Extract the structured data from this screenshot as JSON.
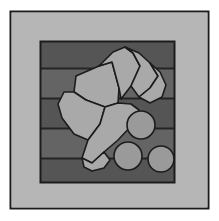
{
  "figure": {
    "width": 219,
    "height": 221,
    "background_color": "#ffffff"
  },
  "colors": {
    "page_background": "#ffffff",
    "frame_fill": "#b6b6b6",
    "panel_dark_band": "#555555",
    "panel_mid_band": "#646464",
    "fragment_fill": "#a9a9a9",
    "circle_fill": "#9a9a9a",
    "outline": "#1c1c1c",
    "band_line": "#242424"
  },
  "outer_frame": {
    "label": "outer-frame-border",
    "x": 10.5,
    "y": 11.5,
    "width": 198,
    "height": 197,
    "stroke_width": 2
  },
  "frame_bands": {
    "label": "light-gray-frame-bands",
    "top": {
      "x": 12,
      "y": 13,
      "width": 195,
      "height": 28
    },
    "left": {
      "x": 12,
      "y": 41,
      "width": 28,
      "height": 142
    },
    "right": {
      "x": 175,
      "y": 41,
      "width": 32,
      "height": 142
    },
    "bottom": {
      "x": 12,
      "y": 183,
      "width": 195,
      "height": 24
    }
  },
  "inner_panel": {
    "label": "striped-inner-panel",
    "x": 40,
    "y": 41,
    "width": 135,
    "height": 142
  },
  "stripes": [
    {
      "name": "stripe-1",
      "y": 41,
      "height": 27,
      "tone": "dark"
    },
    {
      "name": "stripe-2",
      "y": 68,
      "height": 30,
      "tone": "mid"
    },
    {
      "name": "stripe-3",
      "y": 98,
      "height": 30,
      "tone": "dark"
    },
    {
      "name": "stripe-4",
      "y": 128,
      "height": 30,
      "tone": "mid"
    },
    {
      "name": "stripe-5",
      "y": 158,
      "height": 25,
      "tone": "dark"
    }
  ],
  "stripe_lines": [
    68,
    98,
    128,
    158
  ],
  "fragments": [
    {
      "name": "fragment-top-left-wedge",
      "points": "76,76 99,66 112,62 119,88 118,103 105,107 86,100 74,92"
    },
    {
      "name": "fragment-top-center-blade",
      "points": "99,66 113,52 125,47 133,53 140,66 131,86 121,99 119,88 112,62"
    },
    {
      "name": "fragment-top-right-fan",
      "points": "125,47 139,53 150,63 158,76 150,88 139,97 131,86 140,66 133,53"
    },
    {
      "name": "fragment-right-lobe",
      "points": "150,63 160,72 166,85 162,97 150,103 139,97 150,88 158,76"
    },
    {
      "name": "fragment-mid-left-panel",
      "points": "64,92 74,92 86,100 105,107 100,124 88,140 74,134 62,118 58,104"
    },
    {
      "name": "fragment-center-large",
      "points": "105,107 118,103 131,104 139,110 133,124 118,140 104,152 92,163 82,158 88,140 100,124"
    },
    {
      "name": "fragment-bottom-tail",
      "points": "82,158 92,163 104,152 110,160 104,168 92,171 84,167"
    }
  ],
  "circles": [
    {
      "name": "circle-upper-right",
      "cx": 141,
      "cy": 125,
      "r": 14
    },
    {
      "name": "circle-lower-left",
      "cx": 128,
      "cy": 156,
      "r": 14
    },
    {
      "name": "circle-lower-right",
      "cx": 161,
      "cy": 159,
      "r": 13
    }
  ]
}
